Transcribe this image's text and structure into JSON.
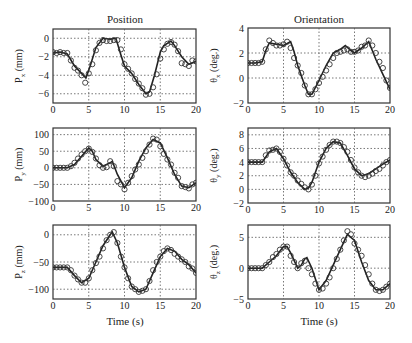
{
  "figure": {
    "columns": [
      {
        "title": "Position"
      },
      {
        "title": "Orientation"
      }
    ],
    "xlabel": "Time (s)"
  },
  "chart_data": [
    {
      "type": "line",
      "panel": "top-left",
      "column_title": "Position",
      "ylabel_main": "P",
      "ylabel_sub": "x",
      "ylabel_unit": " (mm)",
      "xlim": [
        0,
        20
      ],
      "ylim": [
        -7,
        1
      ],
      "xticks": [
        0,
        5,
        10,
        15,
        20
      ],
      "yticks": [
        0,
        -2,
        -4,
        -6
      ],
      "grid": true,
      "series": [
        {
          "name": "line",
          "x": [
            0,
            1,
            2,
            3,
            4,
            4.6,
            5.2,
            6,
            7,
            8,
            8.8,
            9.5,
            10,
            11,
            12,
            13,
            13.5,
            14.2,
            15,
            15.5,
            16.5,
            17,
            18,
            19,
            20
          ],
          "y": [
            -1.6,
            -1.5,
            -1.7,
            -3,
            -3.8,
            -4.3,
            -3,
            -1,
            0,
            -0.1,
            0,
            -1.8,
            -3,
            -3.8,
            -5,
            -6,
            -5.8,
            -4,
            -1.5,
            -0.8,
            -0.3,
            -0.8,
            -2,
            -2.8,
            -2.5
          ]
        },
        {
          "name": "markers",
          "x": [
            0,
            0.5,
            1,
            1.5,
            2,
            2.5,
            3,
            3.5,
            4,
            4.5,
            5,
            5.5,
            6,
            6.5,
            7,
            7.5,
            8,
            8.5,
            9,
            9.5,
            10,
            10.5,
            11,
            11.5,
            12,
            12.5,
            13,
            13.5,
            14,
            14.5,
            15,
            15.5,
            16,
            16.5,
            17,
            17.5,
            18,
            18.5,
            19,
            19.5,
            20
          ],
          "y": [
            -1.5,
            -1.6,
            -1.5,
            -1.6,
            -1.6,
            -2.4,
            -3.2,
            -3.5,
            -4,
            -4.8,
            -3.8,
            -2.8,
            -1.3,
            -0.5,
            -0.2,
            -0.3,
            -0.3,
            -0.2,
            -0.2,
            -1.2,
            -2.8,
            -3.3,
            -3.8,
            -4.4,
            -4.9,
            -5.4,
            -6.1,
            -6,
            -5.3,
            -3.9,
            -2.2,
            -1.2,
            -0.6,
            -0.4,
            -0.7,
            -1.4,
            -2.7,
            -2.8,
            -3,
            -2.4,
            -2.5
          ]
        }
      ]
    },
    {
      "type": "line",
      "panel": "top-right",
      "column_title": "Orientation",
      "ylabel_main": "θ",
      "ylabel_sub": "x",
      "ylabel_unit": " (deg.)",
      "xlim": [
        0,
        20
      ],
      "ylim": [
        -2,
        4
      ],
      "xticks": [
        0,
        5,
        10,
        15,
        20
      ],
      "yticks": [
        4,
        2,
        0,
        -2
      ],
      "grid": true,
      "series": [
        {
          "name": "line",
          "x": [
            0,
            1,
            2,
            2.5,
            3,
            4,
            5,
            6,
            6.5,
            7,
            8,
            8.5,
            9,
            10,
            11,
            12,
            13,
            13.7,
            14.5,
            15,
            16,
            17,
            17.5,
            18,
            19,
            20
          ],
          "y": [
            1.2,
            1.2,
            1.3,
            2.2,
            2.8,
            2.7,
            2.6,
            2.9,
            2.1,
            1,
            -0.6,
            -1.3,
            -1.3,
            -0.2,
            1,
            2,
            2.3,
            2.6,
            2.2,
            2,
            2.4,
            2.9,
            2.2,
            1.5,
            0.3,
            -0.9
          ]
        },
        {
          "name": "markers",
          "x": [
            0,
            0.5,
            1,
            1.5,
            2,
            2.5,
            3,
            3.5,
            4,
            4.5,
            5,
            5.5,
            6,
            6.5,
            7,
            7.5,
            8,
            8.5,
            9,
            9.5,
            10,
            10.5,
            11,
            11.5,
            12,
            12.5,
            13,
            13.5,
            14,
            14.5,
            15,
            15.5,
            16,
            16.5,
            17,
            17.5,
            18,
            18.5,
            19,
            19.5,
            20
          ],
          "y": [
            1.2,
            1.2,
            1.2,
            1.2,
            1.3,
            2.3,
            3,
            2.8,
            2.6,
            2.6,
            2.7,
            2.9,
            2.4,
            1.6,
            1,
            0.4,
            -0.6,
            -1.3,
            -1.3,
            -0.9,
            -0.4,
            0.1,
            0.6,
            1.1,
            1.6,
            2,
            2.1,
            2.2,
            2.3,
            2.1,
            2.1,
            2.2,
            2.5,
            2.6,
            3,
            2.6,
            2,
            1.3,
            0.8,
            -0.2,
            -0.8
          ]
        }
      ]
    },
    {
      "type": "line",
      "panel": "middle-left",
      "ylabel_main": "P",
      "ylabel_sub": "y",
      "ylabel_unit": " (mm)",
      "xlim": [
        0,
        20
      ],
      "ylim": [
        -100,
        120
      ],
      "xticks": [
        0,
        5,
        10,
        15,
        20
      ],
      "yticks": [
        100,
        50,
        0,
        -50,
        -100
      ],
      "grid": true,
      "series": [
        {
          "name": "line",
          "x": [
            0,
            1,
            2,
            3,
            4,
            5,
            5.5,
            6,
            7,
            8,
            8.3,
            9,
            10,
            11,
            12,
            13,
            14,
            15,
            16,
            17,
            18,
            19,
            20
          ],
          "y": [
            0,
            0,
            0,
            10,
            35,
            60,
            50,
            25,
            5,
            15,
            20,
            -20,
            -60,
            -30,
            20,
            60,
            85,
            75,
            30,
            -20,
            -55,
            -60,
            -45
          ]
        },
        {
          "name": "markers",
          "x": [
            0,
            0.5,
            1,
            1.5,
            2,
            2.5,
            3,
            3.5,
            4,
            4.5,
            5,
            5.5,
            6,
            6.5,
            7,
            7.5,
            8,
            8.5,
            9,
            9.5,
            10,
            10.5,
            11,
            11.5,
            12,
            12.5,
            13,
            13.5,
            14,
            14.5,
            15,
            15.5,
            16,
            16.5,
            17,
            17.5,
            18,
            18.5,
            19,
            19.5,
            20
          ],
          "y": [
            0,
            0,
            0,
            0,
            0,
            5,
            15,
            28,
            40,
            50,
            58,
            48,
            28,
            8,
            0,
            2,
            20,
            5,
            -40,
            -50,
            -65,
            -45,
            -25,
            -5,
            10,
            30,
            50,
            70,
            88,
            85,
            65,
            42,
            25,
            10,
            -15,
            -30,
            -55,
            -58,
            -62,
            -50,
            -45
          ]
        }
      ]
    },
    {
      "type": "line",
      "panel": "middle-right",
      "ylabel_main": "θ",
      "ylabel_sub": "y",
      "ylabel_unit": " (deg.)",
      "xlim": [
        0,
        20
      ],
      "ylim": [
        -2,
        9
      ],
      "xticks": [
        0,
        5,
        10,
        15,
        20
      ],
      "yticks": [
        8,
        6,
        4,
        2,
        0,
        -2
      ],
      "grid": true,
      "series": [
        {
          "name": "line",
          "x": [
            0,
            1,
            2,
            3,
            4,
            5,
            6,
            7,
            8,
            8.5,
            9,
            10,
            11,
            12,
            13,
            14,
            15,
            16,
            17,
            18,
            19,
            20
          ],
          "y": [
            4,
            4,
            4,
            5.5,
            6,
            4.5,
            2.5,
            1,
            0,
            0.2,
            1,
            4,
            6,
            7,
            6.8,
            5,
            3,
            2,
            2.3,
            3,
            3.7,
            4.3
          ]
        },
        {
          "name": "markers",
          "x": [
            0,
            0.5,
            1,
            1.5,
            2,
            2.5,
            3,
            3.5,
            4,
            4.5,
            5,
            5.5,
            6,
            6.5,
            7,
            7.5,
            8,
            8.5,
            9,
            9.5,
            10,
            10.5,
            11,
            11.5,
            12,
            12.5,
            13,
            13.5,
            14,
            14.5,
            15,
            15.5,
            16,
            16.5,
            17,
            17.5,
            18,
            18.5,
            19,
            19.5,
            20
          ],
          "y": [
            4,
            4,
            4,
            4,
            4,
            5,
            5.7,
            5.8,
            6,
            5.5,
            4.5,
            3.5,
            2.5,
            2,
            1.3,
            0.8,
            0.3,
            0,
            0.7,
            2,
            3.8,
            4.8,
            5.8,
            6.5,
            7,
            7,
            6.8,
            6.2,
            5.5,
            4.3,
            3.2,
            2.5,
            2,
            1.8,
            2,
            2.3,
            2.7,
            3,
            3.5,
            4,
            4.3
          ]
        }
      ]
    },
    {
      "type": "line",
      "panel": "bottom-left",
      "ylabel_main": "P",
      "ylabel_sub": "z",
      "ylabel_unit": " (mm)",
      "xlim": [
        0,
        20
      ],
      "ylim": [
        -118,
        18
      ],
      "xticks": [
        0,
        5,
        10,
        15,
        20
      ],
      "yticks": [
        0,
        -50,
        -100
      ],
      "grid": true,
      "series": [
        {
          "name": "line",
          "x": [
            0,
            1,
            2,
            3,
            4,
            5,
            6,
            7,
            8,
            8.3,
            9,
            10,
            11,
            12,
            13,
            14,
            15,
            16,
            17,
            18,
            19,
            20
          ],
          "y": [
            -60,
            -60,
            -60,
            -75,
            -88,
            -80,
            -50,
            -20,
            0,
            5,
            -15,
            -60,
            -95,
            -105,
            -100,
            -70,
            -40,
            -25,
            -30,
            -45,
            -55,
            -70
          ]
        },
        {
          "name": "markers",
          "x": [
            0,
            0.5,
            1,
            1.5,
            2,
            2.5,
            3,
            3.5,
            4,
            4.5,
            5,
            5.5,
            6,
            6.5,
            7,
            7.5,
            8,
            8.5,
            9,
            9.5,
            10,
            10.5,
            11,
            11.5,
            12,
            12.5,
            13,
            13.5,
            14,
            14.5,
            15,
            15.5,
            16,
            16.5,
            17,
            17.5,
            18,
            18.5,
            19,
            19.5,
            20
          ],
          "y": [
            -60,
            -60,
            -60,
            -60,
            -60,
            -65,
            -75,
            -82,
            -88,
            -88,
            -80,
            -65,
            -52,
            -40,
            -25,
            -10,
            0,
            5,
            -15,
            -40,
            -60,
            -80,
            -95,
            -100,
            -105,
            -103,
            -100,
            -85,
            -65,
            -50,
            -40,
            -30,
            -25,
            -28,
            -35,
            -40,
            -45,
            -50,
            -58,
            -62,
            -70
          ]
        }
      ]
    },
    {
      "type": "line",
      "panel": "bottom-right",
      "ylabel_main": "θ",
      "ylabel_sub": "z",
      "ylabel_unit": " (deg.)",
      "xlim": [
        0,
        20
      ],
      "ylim": [
        -5,
        7
      ],
      "xticks": [
        0,
        5,
        10,
        15,
        20
      ],
      "yticks": [
        5,
        0,
        -5
      ],
      "grid": true,
      "series": [
        {
          "name": "line",
          "x": [
            0,
            1,
            2,
            3,
            4,
            5,
            5.5,
            6,
            7,
            7.5,
            8,
            8.3,
            9,
            10,
            11,
            12,
            13,
            14,
            15,
            16,
            17,
            18,
            19,
            20
          ],
          "y": [
            0,
            0,
            0,
            1,
            2,
            3.5,
            3.5,
            2.5,
            0,
            0.5,
            1.5,
            1.7,
            0,
            -3.5,
            -2,
            0.5,
            3,
            5.5,
            4.5,
            1,
            -2,
            -3.5,
            -3.5,
            -2.5
          ]
        },
        {
          "name": "markers",
          "x": [
            0,
            0.5,
            1,
            1.5,
            2,
            2.5,
            3,
            3.5,
            4,
            4.5,
            5,
            5.5,
            6,
            6.5,
            7,
            7.5,
            8,
            8.5,
            9,
            9.5,
            10,
            10.5,
            11,
            11.5,
            12,
            12.5,
            13,
            13.5,
            14,
            14.5,
            15,
            15.5,
            16,
            16.5,
            17,
            17.5,
            18,
            18.5,
            19,
            19.5,
            20
          ],
          "y": [
            0,
            0,
            0,
            0,
            0,
            0.5,
            1,
            1.8,
            2.3,
            3,
            3.5,
            3.5,
            2,
            1,
            0,
            0.8,
            1.2,
            0,
            -1,
            -2.5,
            -3.5,
            -3.3,
            -2.5,
            -1.5,
            0,
            1.5,
            3,
            4.5,
            6,
            5.5,
            4,
            3,
            2,
            0.5,
            -1,
            -2.5,
            -3.5,
            -3.7,
            -3.5,
            -3,
            -2.5
          ]
        }
      ]
    }
  ]
}
